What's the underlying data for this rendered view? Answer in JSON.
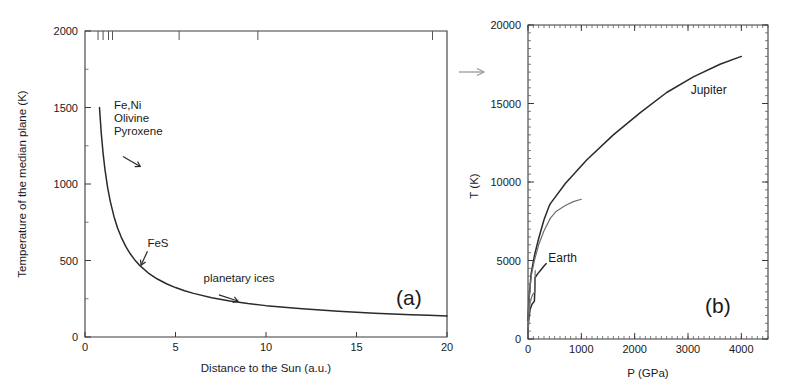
{
  "figure": {
    "background": "#ffffff",
    "ink_color": "#2a2a2a",
    "secondary_ink_color": "#6e6e6e",
    "link_arrow": {
      "name": "panel-link-arrow",
      "direction": "right"
    }
  },
  "chart_data": [
    {
      "id": "panel-a",
      "type": "line",
      "panel_label": "(a)",
      "title": "",
      "xlabel": "Distance to the Sun (a.u.)",
      "ylabel": "Temperature of the median plane (K)",
      "xlim": [
        0,
        20
      ],
      "ylim": [
        0,
        2000
      ],
      "xticks": [
        0,
        5,
        10,
        15,
        20
      ],
      "xticklabels": [
        "0",
        "5",
        "10",
        "15",
        "20"
      ],
      "yticks": [
        0,
        500,
        1000,
        1500,
        2000
      ],
      "yticklabels": [
        "0",
        "500",
        "1000",
        "1500",
        "2000"
      ],
      "y_minor_ticks": [
        250,
        750,
        1250,
        1750
      ],
      "grid": false,
      "legend": "none",
      "series": [
        {
          "name": "median plane temperature",
          "color": "#2a2a2a",
          "x": [
            0.8,
            0.9,
            1.0,
            1.1,
            1.25,
            1.4,
            1.6,
            1.8,
            2.0,
            2.25,
            2.5,
            2.75,
            3.0,
            3.5,
            4.0,
            4.5,
            5.0,
            5.5,
            6.0,
            7.0,
            8.0,
            9.0,
            10.0,
            11.0,
            12.0,
            13.0,
            14.0,
            15.0,
            16.0,
            17.0,
            18.0,
            19.0,
            20.0
          ],
          "y": [
            1500,
            1330,
            1200,
            1097,
            977,
            885,
            788,
            713,
            653,
            592,
            544,
            504,
            470,
            418,
            379,
            348,
            323,
            302,
            285,
            257,
            236,
            219,
            205,
            194,
            184,
            176,
            168,
            162,
            156,
            151,
            146,
            142,
            138
          ]
        }
      ],
      "planet_markers": {
        "name": "planet-position-ticks",
        "axis": "top",
        "values": [
          0.72,
          1.0,
          1.3,
          1.52,
          5.2,
          9.55,
          19.2
        ],
        "note": "short vertical ticks hanging from the top frame"
      },
      "annotations": [
        {
          "id": "fe-ni-olivine-pyroxene",
          "lines": [
            "Fe,Ni",
            "Olivine",
            "Pyroxene"
          ],
          "text_x": 1.6,
          "text_y": 1490,
          "arrow_from": [
            2.1,
            1180
          ],
          "arrow_to": [
            3.05,
            1115
          ]
        },
        {
          "id": "fes",
          "lines": [
            "FeS"
          ],
          "text_x": 3.45,
          "text_y": 590,
          "arrow_from": [
            3.45,
            560
          ],
          "arrow_to": [
            3.1,
            470
          ]
        },
        {
          "id": "planetary-ices",
          "lines": [
            "planetary ices"
          ],
          "text_x": 6.55,
          "text_y": 360,
          "arrow_from": [
            7.4,
            275
          ],
          "arrow_to": [
            8.45,
            235
          ]
        }
      ]
    },
    {
      "id": "panel-b",
      "type": "line",
      "panel_label": "(b)",
      "title": "",
      "xlabel": "P (GPa)",
      "ylabel": "T (K)",
      "xlim": [
        0,
        4500
      ],
      "ylim": [
        0,
        20000
      ],
      "xticks": [
        0,
        1000,
        2000,
        3000,
        4000
      ],
      "xticklabels": [
        "0",
        "1000",
        "2000",
        "3000",
        "4000"
      ],
      "yticks": [
        0,
        5000,
        10000,
        15000,
        20000
      ],
      "yticklabels": [
        "0",
        "5000",
        "10000",
        "15000",
        "20000"
      ],
      "x_minor_step": 100,
      "y_minor_step": 500,
      "grid": false,
      "legend": "inline-labels",
      "series": [
        {
          "name": "Jupiter",
          "color": "#2a2a2a",
          "label_x": 3050,
          "label_y": 15600,
          "x": [
            0,
            20,
            60,
            120,
            200,
            300,
            400,
            420,
            700,
            1100,
            1600,
            2100,
            2600,
            3100,
            3600,
            4000
          ],
          "y": [
            1200,
            2600,
            4200,
            5300,
            6400,
            7600,
            8500,
            8620,
            9900,
            11400,
            13000,
            14400,
            15700,
            16700,
            17500,
            18000
          ]
        },
        {
          "name": "Jupiter (alternative model)",
          "color": "#6e6e6e",
          "x": [
            0,
            20,
            60,
            120,
            200,
            300,
            420,
            520,
            560,
            700,
            850,
            1000
          ],
          "y": [
            1200,
            2500,
            4000,
            5000,
            6000,
            6900,
            7700,
            8100,
            8200,
            8500,
            8750,
            8900
          ]
        },
        {
          "name": "Earth",
          "color": "#2a2a2a",
          "label_x": 380,
          "label_y": 4900,
          "x": [
            0,
            10,
            40,
            80,
            120,
            128,
            132,
            180,
            240,
            300,
            340
          ],
          "y": [
            300,
            1100,
            1900,
            2250,
            2400,
            3150,
            3900,
            4150,
            4400,
            4650,
            4800
          ]
        },
        {
          "name": "Earth (lower branch)",
          "color": "#6e6e6e",
          "x": [
            0,
            15,
            40,
            70,
            100,
            130,
            135
          ],
          "y": [
            300,
            1400,
            2300,
            2700,
            2900,
            2980,
            4350
          ]
        }
      ],
      "annotations": []
    }
  ]
}
